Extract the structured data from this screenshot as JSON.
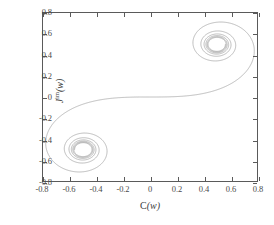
{
  "chart_data": {
    "type": "line",
    "title": "",
    "xlabel": "C(w)",
    "ylabel": "J im(w)",
    "ylabel_parts": {
      "base": "J",
      "superscript": "im",
      "arg": "(w)"
    },
    "xlim": [
      -0.8,
      0.8
    ],
    "ylim": [
      -0.8,
      0.8
    ],
    "grid": false,
    "legend": null,
    "curve_name": "Cornu spiral (Fresnel integrals)",
    "xticks": [
      "-0.8",
      "-0.6",
      "-0.4",
      "-0.2",
      "0",
      "0.2",
      "0.4",
      "0.6",
      "0.8"
    ],
    "xtick_values": [
      -0.8,
      -0.6,
      -0.4,
      -0.2,
      0,
      0.2,
      0.4,
      0.6,
      0.8
    ],
    "yticks": [
      "0.8",
      "0.6",
      "0.4",
      "0.2",
      "0",
      "-0.2",
      "-0.4",
      "-0.6",
      "-0.8"
    ],
    "ytick_values": [
      0.8,
      0.6,
      0.4,
      0.2,
      0,
      -0.2,
      -0.4,
      -0.6,
      -0.8
    ],
    "asymptote_points": [
      {
        "label": "upper-right spiral centre",
        "x": 0.5,
        "y": 0.5
      },
      {
        "label": "lower-left spiral centre",
        "x": -0.5,
        "y": -0.5
      }
    ],
    "t_range": [
      -5.0,
      5.0
    ],
    "t_samples": 4000,
    "line_color": "#8f8f8f",
    "axis_color": "#5a5a5a",
    "background": "#ffffff"
  },
  "axes": {
    "x_tick_labels": [
      "-0.8",
      "-0.6",
      "-0.4",
      "-0.2",
      "0",
      "0.2",
      "0.4",
      "0.6",
      "0.8"
    ],
    "y_tick_labels": [
      "0.8",
      "0.6",
      "0.4",
      "0.2",
      "0",
      "-0.2",
      "-0.4",
      "-0.6",
      "-0.8"
    ]
  }
}
